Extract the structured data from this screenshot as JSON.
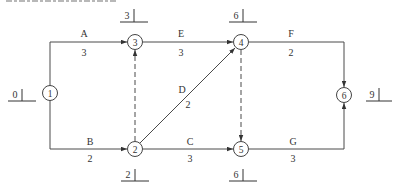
{
  "diagram": {
    "type": "activity-on-arrow network (double-code network diagram)",
    "colors": {
      "line": "#4a4a4a",
      "text": "#333333",
      "background": "#ffffff"
    },
    "nodes": [
      {
        "id": "1",
        "label": "1",
        "x": 50,
        "y": 93,
        "time": "0"
      },
      {
        "id": "2",
        "label": "2",
        "x": 135,
        "y": 149,
        "time": "2"
      },
      {
        "id": "3",
        "label": "3",
        "x": 135,
        "y": 42,
        "time": "3"
      },
      {
        "id": "4",
        "label": "4",
        "x": 241,
        "y": 42,
        "time": "6"
      },
      {
        "id": "5",
        "label": "5",
        "x": 241,
        "y": 149,
        "time": "6"
      },
      {
        "id": "6",
        "label": "6",
        "x": 344,
        "y": 95,
        "time": "9"
      }
    ],
    "activities": [
      {
        "name": "A",
        "duration": "3",
        "from": "1",
        "to": "3"
      },
      {
        "name": "B",
        "duration": "2",
        "from": "1",
        "to": "2"
      },
      {
        "name": "E",
        "duration": "3",
        "from": "3",
        "to": "4"
      },
      {
        "name": "D",
        "duration": "2",
        "from": "2",
        "to": "4"
      },
      {
        "name": "C",
        "duration": "3",
        "from": "2",
        "to": "5"
      },
      {
        "name": "F",
        "duration": "2",
        "from": "4",
        "to": "6"
      },
      {
        "name": "G",
        "duration": "3",
        "from": "5",
        "to": "6"
      }
    ],
    "dummy_activities": [
      {
        "from": "2",
        "to": "3"
      },
      {
        "from": "4",
        "to": "5"
      }
    ]
  },
  "labels": {
    "node1": "1",
    "node2": "2",
    "node3": "3",
    "node4": "4",
    "node5": "5",
    "node6": "6",
    "time1": "0",
    "time2": "2",
    "time3": "3",
    "time4": "6",
    "time5": "6",
    "time6": "9",
    "act_A": "A",
    "dur_A": "3",
    "act_B": "B",
    "dur_B": "2",
    "act_E": "E",
    "dur_E": "3",
    "act_D": "D",
    "dur_D": "2",
    "act_C": "C",
    "dur_C": "3",
    "act_F": "F",
    "dur_F": "2",
    "act_G": "G",
    "dur_G": "3"
  }
}
